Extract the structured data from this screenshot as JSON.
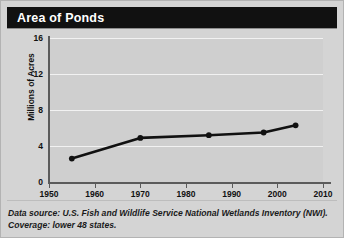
{
  "header": {
    "title": "Area of Ponds"
  },
  "footnote": {
    "line1": "Data source: U.S. Fish and Wildlife Service National Wetlands Inventory",
    "line2": "(NWI). Coverage: lower 48 states."
  },
  "colors": {
    "title_bar": "#111111",
    "title_text": "#ffffff",
    "panel_background": "#d4d4d4",
    "plot_background": "#cfcfcf",
    "gridline": "#f2f2f2",
    "axis": "#5b5b5b",
    "series": "#111111"
  },
  "chart_data": {
    "type": "line",
    "title": "Area of Ponds",
    "xlabel": "",
    "ylabel": "Millions of Acres",
    "xlim": [
      1950,
      2010
    ],
    "ylim": [
      0,
      16
    ],
    "xticks": [
      1950,
      1960,
      1970,
      1980,
      1990,
      2000,
      2010
    ],
    "yticks": [
      0,
      4,
      8,
      12,
      16
    ],
    "grid": true,
    "legend": "none",
    "series": [
      {
        "name": "Area of Ponds",
        "marker": "circle",
        "x": [
          1955,
          1970,
          1985,
          1997,
          2004
        ],
        "values": [
          2.6,
          4.9,
          5.2,
          5.5,
          6.3
        ]
      }
    ]
  }
}
